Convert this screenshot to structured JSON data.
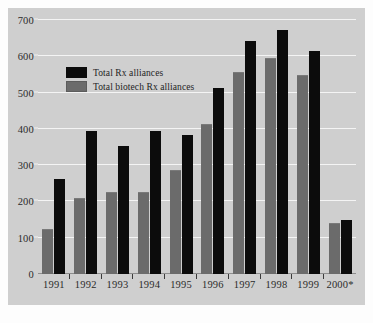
{
  "chart_data": {
    "type": "bar",
    "title": "",
    "xlabel": "",
    "ylabel": "",
    "ylim": [
      0,
      700
    ],
    "yticks": [
      0,
      100,
      200,
      300,
      400,
      500,
      600,
      700
    ],
    "ytick_labels": [
      "0",
      "100",
      "200",
      "300",
      "400",
      "500",
      "600",
      "700"
    ],
    "grid": true,
    "legend_position": "upper-left-inside",
    "categories": [
      "1991",
      "1992",
      "1993",
      "1994",
      "1995",
      "1996",
      "1997",
      "1998",
      "1999",
      "2000*"
    ],
    "series": [
      {
        "name": "Total biotech Rx alliances",
        "color": "#6b6b6b",
        "values": [
          122,
          207,
          222,
          222,
          283,
          412,
          554,
          592,
          545,
          138
        ]
      },
      {
        "name": "Total Rx alliances",
        "color": "#0c0c0c",
        "values": [
          261,
          393,
          353,
          393,
          383,
          512,
          643,
          672,
          615,
          148
        ]
      }
    ],
    "series_draw_order": [
      "Total biotech Rx alliances",
      "Total Rx alliances"
    ]
  },
  "legend": {
    "items": [
      {
        "label": "Total Rx alliances",
        "swatch": "total"
      },
      {
        "label": "Total biotech Rx alliances",
        "swatch": "biotech"
      }
    ]
  },
  "colors": {
    "panel_background": "#cfcfcf",
    "gridline": "#f4f4f4",
    "axis": "#8d8d8d",
    "total_bar": "#0c0c0c",
    "biotech_bar": "#6b6b6b",
    "text": "#2b2b2b"
  }
}
